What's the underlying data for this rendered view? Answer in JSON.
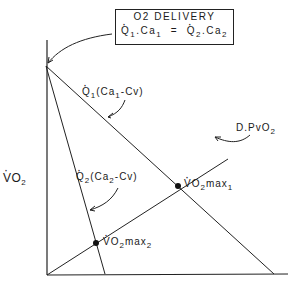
{
  "box": {
    "title": "O2 DELIVERY",
    "equation_left_q": "Q",
    "equation_left_sub": "1",
    "equation_left_ca": ".Ca",
    "equation_left_ca_sub": "1",
    "equals": "=",
    "equation_right_q": "Q",
    "equation_right_sub": "2",
    "equation_right_ca": ".Ca",
    "equation_right_ca_sub": "2"
  },
  "labels": {
    "q1_line": {
      "q": "Q",
      "sub": "1",
      "rest": "(Ca",
      "rest_sub": "1",
      "tail": "-Cv)"
    },
    "q2_line": {
      "q": "Q",
      "sub": "2",
      "rest": "(Ca",
      "rest_sub": "2",
      "tail": "-Cv)"
    },
    "diffusion_line": {
      "text": "D.PvO",
      "sub": "2"
    },
    "y_axis": {
      "text": "VO",
      "sub": "2"
    },
    "vo2max1": {
      "text": "VO",
      "sub": "2",
      "tail": "max",
      "tail_sub": "1"
    },
    "vo2max2": {
      "text": "VO",
      "sub": "2",
      "tail": "max",
      "tail_sub": "2"
    }
  },
  "colors": {
    "line": "#222222",
    "background": "#ffffff"
  }
}
